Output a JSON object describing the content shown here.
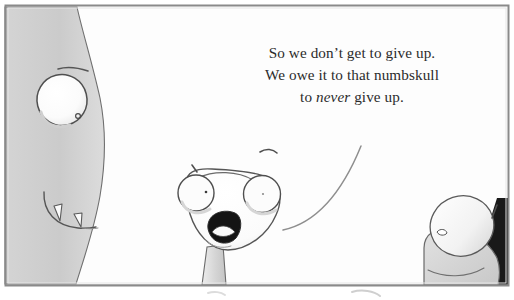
{
  "comic": {
    "panel_label": "comic-panel",
    "background_color": "#ffffff",
    "border_color": "#8a8a8a",
    "ink_color": "#4a4a4a",
    "dark_shadow_color": "#1c1c1c",
    "creature_fill": "#cfcfcf",
    "creature_fill_light": "#e6e6e6",
    "eye_fill": "#fcfcfc",
    "dialogue": {
      "speaker": "center-character",
      "lines": [
        "So we don’t get to give up.",
        "We owe it to that numbskull",
        "to "
      ],
      "line1": "So we don’t get to give up.",
      "line2": "We owe it to that numbskull",
      "line3_before": "to ",
      "line3_emphasis": "never",
      "line3_after": " give up.",
      "full_text": "So we don’t get to give up. We owe it to that numbskull to never give up."
    },
    "characters": [
      {
        "id": "big-creature-left",
        "name": "large monster head in profile",
        "features": [
          "large white eye",
          "tiny pupil",
          "brow line",
          "two triangular teeth"
        ]
      },
      {
        "id": "center-character",
        "name": "triangular-headed character shouting",
        "features": [
          "two bulging eyes",
          "small eyebrows",
          "open mouth with fang",
          "thin neck"
        ]
      },
      {
        "id": "right-creature",
        "name": "rounded creature at bottom right",
        "features": [
          "round pale head",
          "small eye",
          "shoulder/body",
          "dark corner shadow"
        ]
      }
    ],
    "speech_tail": {
      "id": "speech-balloon-tail",
      "description": "curved line from dialogue down to the center character"
    }
  }
}
